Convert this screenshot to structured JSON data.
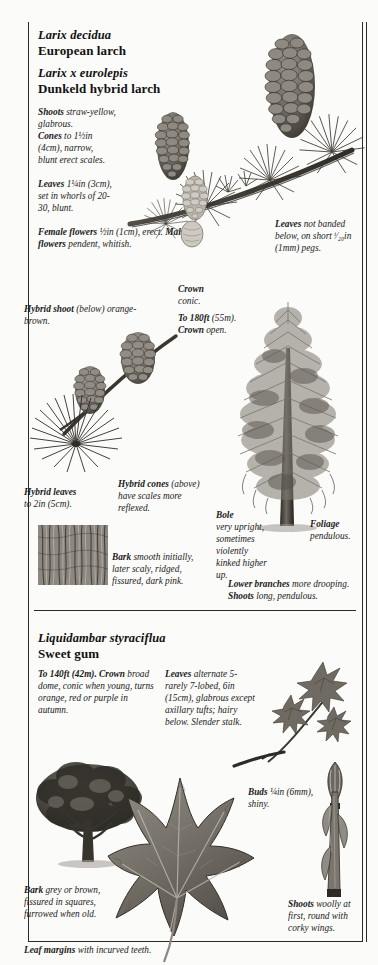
{
  "page": {
    "sections": [
      {
        "id": "larch",
        "scientific_name": "Larix decidua",
        "common_name": "European larch",
        "scientific_name_2": "Larix x eurolepis",
        "common_name_2": "Dunkeld hybrid larch"
      },
      {
        "id": "sweetgum",
        "scientific_name": "Liquidambar styraciflua",
        "common_name": "Sweet gum"
      }
    ]
  },
  "larch": {
    "desc_shoots_label": "Shoots",
    "desc_shoots_text": " straw-yellow, glabrous.",
    "desc_cones_label": "Cones",
    "desc_cones_text": " to 1½in (4cm), narrow, blunt erect scales.",
    "desc_leaves_label": "Leaves",
    "desc_leaves_text": " 1¼in (3cm), set in whorls of 20-30, blunt.",
    "desc_flowers_label_f": "Female flowers",
    "desc_flowers_text_f": " ½in (1cm), erect. ",
    "desc_flowers_label_m": "Male flowers",
    "desc_flowers_text_m": " pendent, whitish.",
    "leaves_caption_label": "Leaves",
    "leaves_caption_text": " not banded below, on short ⁱ⁄₂₀in (1mm) pegs.",
    "hybrid_shoot_label": "Hybrid shoot",
    "hybrid_shoot_text": " (below) orange-brown.",
    "crown_label": "Crown",
    "crown_text": " conic.",
    "height_label": "To 180ft",
    "height_text": " (55m). ",
    "crown_open_label": "Crown",
    "crown_open_text": " open.",
    "hybrid_leaves_label": "Hybrid leaves",
    "hybrid_leaves_text": " to 2in (5cm).",
    "hybrid_cones_label": "Hybrid cones",
    "hybrid_cones_text": " (above) have scales more reflexed.",
    "bole_label": "Bole",
    "bole_text": " very upright, sometimes violently kinked higher up.",
    "foliage_label": "Foliage",
    "foliage_text": " pendulous.",
    "bark_label": "Bark",
    "bark_text": " smooth initially, later scaly, ridged, fissured, dark pink.",
    "lower_branches_label": "Lower branches",
    "lower_branches_text": " more drooping. ",
    "shoots2_label": "Shoots",
    "shoots2_text": " long, pendulous."
  },
  "sweetgum": {
    "height_label": "To 140ft (42m). Crown",
    "height_text": " broad dome, conic when young, turns orange, red or purple in autumn.",
    "leaves_label": "Leaves",
    "leaves_text": " alternate 5- rarely 7-lobed, 6in (15cm), glabrous except axillary tufts; hairy below. Slender stalk.",
    "buds_label": "Buds",
    "buds_text": " ¼in (6mm), shiny.",
    "bark_label": "Bark",
    "bark_text": " grey or brown, fissured in squares, furrowed when old.",
    "shoots_label": "Shoots",
    "shoots_text": " woolly at first, round with corky wings.",
    "leaf_margins_label": "Leaf margins",
    "leaf_margins_text": " with incurved teeth."
  },
  "colors": {
    "ink": "#111111",
    "rule": "#2a2a2a",
    "paper": "#fbfbf9",
    "illustration_dark": "#4a4a46",
    "illustration_mid": "#7d7d76",
    "illustration_light": "#b5b5ad"
  }
}
